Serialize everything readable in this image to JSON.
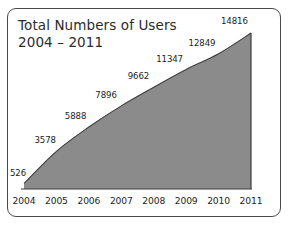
{
  "chart_data": {
    "type": "area",
    "title": "Total Numbers of Users",
    "subtitle": "2004 – 2011",
    "xlabel": "",
    "ylabel": "",
    "categories": [
      "2004",
      "2005",
      "2006",
      "2007",
      "2008",
      "2009",
      "2010",
      "2011"
    ],
    "values": [
      526,
      3578,
      5888,
      7896,
      9662,
      11347,
      12849,
      14816
    ],
    "value_labels": [
      "526",
      "3578",
      "5888",
      "7896",
      "9662",
      "11347",
      "12849",
      "14816"
    ],
    "ylim": [
      0,
      14816
    ],
    "grid": false,
    "legend": false,
    "series": [
      {
        "name": "Total Numbers of Users",
        "values": [
          526,
          3578,
          5888,
          7896,
          9662,
          11347,
          12849,
          14816
        ]
      }
    ],
    "colors": {
      "area_fill": "#8b8b8b",
      "area_stroke": "#3d3d3d",
      "axis": "#3d3d3d",
      "text": "#1d1d1d",
      "border": "#4a4a4a",
      "background": "#ffffff"
    }
  },
  "card": {
    "border_color": "#4a4a4a"
  }
}
